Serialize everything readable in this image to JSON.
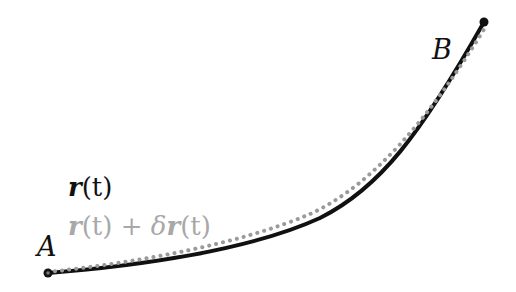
{
  "diagram": {
    "type": "path-variation",
    "colors": {
      "background": "#ffffff",
      "path": "#111111",
      "varied_path": "#9a9a9a",
      "varied_label": "#a8a8a8"
    },
    "points": {
      "A": {
        "label": "A",
        "x": 48,
        "y": 273
      },
      "B": {
        "label": "B",
        "x": 484,
        "y": 22
      }
    },
    "legend": {
      "path": {
        "vec": "r",
        "arg": "(t)"
      },
      "varied_path": {
        "vec": "r",
        "arg": "(t)",
        "plus": " + ",
        "delta": "δ",
        "vec2": "r",
        "arg2": "(t)"
      }
    },
    "curves": {
      "path_d": "M48,273 C140,266 250,250 320,218 C380,188 420,135 484,22",
      "varied_path_d": "M48,272 C140,262 240,244 310,214 C372,186 430,118 486,26"
    }
  }
}
